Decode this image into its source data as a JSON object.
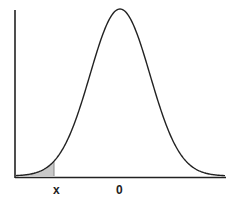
{
  "chart_data": {
    "type": "area",
    "title": "",
    "xlabel": "",
    "ylabel": "",
    "distribution": {
      "name": "normal",
      "mean": 0,
      "sd": 1
    },
    "tick_labels": [
      "x",
      "0"
    ],
    "shaded_region": {
      "from": "-inf",
      "to": "x",
      "approx_z": -2.2
    },
    "xlim": [
      -3.6,
      3.5
    ],
    "grid": false,
    "legend": null
  },
  "labels": {
    "x_marker": "x",
    "zero_marker": "0"
  },
  "colors": {
    "curve": "#222222",
    "axis": "#222222",
    "shade": "#c8c8c8"
  }
}
